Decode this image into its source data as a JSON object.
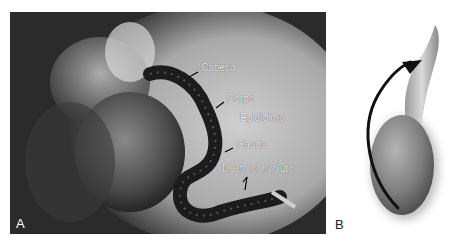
{
  "figure": {
    "panels": [
      {
        "id": "A",
        "type": "photograph",
        "letter": "A",
        "labels": {
          "cabeca": "Cabeça",
          "corpo": "Corpo",
          "epididimo": "Epidídimo",
          "cauda": "Cauda",
          "ducto": "Ducto convoluto"
        }
      },
      {
        "id": "B",
        "type": "illustration",
        "letter": "B"
      }
    ],
    "colors": {
      "photo_background": "#2a2a2a",
      "label_text": "#f2f2f2",
      "tissue_dark": "#1c1c1c",
      "arrow": "#111111",
      "testis_gray": "#8c8c8c"
    }
  }
}
